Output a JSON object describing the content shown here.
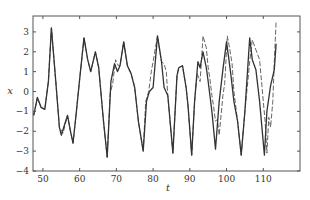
{
  "chart_data": {
    "type": "line",
    "title": "",
    "xlabel": "t",
    "ylabel": "x",
    "xlim": [
      47.3,
      120
    ],
    "ylim": [
      -4,
      3.8
    ],
    "xticks": [
      50,
      60,
      70,
      80,
      90,
      100,
      110
    ],
    "yticks": [
      -4,
      -3,
      -2,
      -1,
      0,
      1,
      2,
      3
    ],
    "grid": false,
    "legend": null,
    "series": [
      {
        "name": "true",
        "style": "solid",
        "color": "#333333",
        "t": [
          47.5,
          48.5,
          49.5,
          50.5,
          51.5,
          52.3,
          53.5,
          54.5,
          55,
          56,
          56.7,
          57.5,
          58.2,
          59,
          60,
          61.2,
          62.2,
          63,
          64.3,
          65.2,
          66.5,
          67.5,
          68.5,
          69.5,
          70.3,
          71,
          72,
          73,
          74,
          75,
          76,
          77.3,
          78.2,
          79,
          80,
          81.2,
          82.3,
          83,
          84,
          85.4,
          86.5,
          87,
          88,
          89,
          89.5,
          90.5,
          91.3,
          92.2,
          92.8,
          93.6,
          94.5,
          95,
          96,
          97,
          98,
          99,
          100,
          100.5,
          101.2,
          102,
          103,
          104,
          105,
          106.3,
          107,
          108,
          109,
          110.3,
          111,
          112,
          113,
          113.5
        ],
        "x": [
          -1.2,
          -0.3,
          -0.8,
          -0.9,
          0.5,
          3.2,
          0.5,
          -1.8,
          -2.2,
          -1.6,
          -1.2,
          -2.0,
          -2.6,
          -1.2,
          0.6,
          2.7,
          1.6,
          1.0,
          2.0,
          1.2,
          -1.5,
          -3.3,
          0.5,
          1.4,
          1.0,
          1.3,
          2.5,
          1.3,
          0.9,
          0.2,
          -1.5,
          -3.0,
          -0.5,
          0.0,
          0.2,
          2.8,
          1.5,
          0.2,
          -0.2,
          -3.1,
          0.8,
          1.2,
          1.3,
          0.2,
          -0.7,
          -3.2,
          -0.5,
          1.5,
          1.2,
          2.0,
          1.2,
          0.5,
          -1.0,
          -2.9,
          -0.5,
          1.1,
          2.5,
          1.8,
          0.8,
          -0.5,
          -1.5,
          -3.2,
          -1.0,
          2.7,
          1.6,
          1.1,
          -0.5,
          -3.2,
          -1.0,
          0.3,
          1.1,
          2.4
        ]
      },
      {
        "name": "prediction",
        "style": "dashed",
        "color": "#555555",
        "t": [
          47.5,
          48.5,
          49.5,
          50.5,
          51.5,
          52.3,
          53.5,
          54.5,
          55.5,
          56.7,
          57.5,
          58.2,
          59,
          60,
          61.2,
          62.2,
          63,
          64.3,
          65.2,
          66.5,
          67.5,
          68.3,
          69,
          69.8,
          70.5,
          71,
          72,
          73,
          74,
          75,
          76,
          77.3,
          78,
          78.8,
          79.5,
          80,
          81.2,
          82.3,
          83,
          83.6,
          84,
          85.4,
          86.5,
          87,
          88,
          89,
          89.5,
          90.5,
          91.3,
          92,
          92.8,
          93.6,
          94.5,
          95,
          95.5,
          96,
          96.5,
          97,
          97.5,
          98,
          99,
          99.5,
          100.2,
          100.8,
          101.5,
          102,
          103,
          104,
          105,
          106.3,
          107,
          108,
          109,
          110,
          110.5,
          111,
          111.5,
          112,
          112.6,
          113,
          113.5
        ],
        "x": [
          -1.2,
          -0.3,
          -0.8,
          -0.9,
          0.5,
          3.2,
          0.5,
          -1.8,
          -2.1,
          -1.2,
          -2.0,
          -2.6,
          -1.2,
          0.6,
          2.7,
          1.6,
          1.0,
          2.0,
          1.2,
          -1.5,
          -3.3,
          -0.1,
          0.4,
          1.6,
          1.3,
          1.3,
          2.5,
          1.3,
          0.9,
          0.2,
          -1.5,
          -3.0,
          -0.5,
          0.0,
          1.0,
          1.5,
          2.8,
          1.5,
          1.4,
          1.0,
          -0.2,
          -3.1,
          0.8,
          1.2,
          1.3,
          0.2,
          -0.7,
          -3.2,
          -0.5,
          0.9,
          0.5,
          2.8,
          2.2,
          1.2,
          0.6,
          -0.2,
          -0.8,
          -1.5,
          -1.4,
          -2.2,
          -0.2,
          0.4,
          2.8,
          2.2,
          1.4,
          0.0,
          -1.5,
          -3.2,
          -1.0,
          1.5,
          2.6,
          2.1,
          1.6,
          -0.5,
          -1.5,
          -3.1,
          -1.3,
          -1.8,
          -0.5,
          1.5,
          3.5
        ]
      }
    ]
  },
  "axes": {
    "xlabel": "t",
    "ylabel": "x",
    "xtick_labels": [
      "50",
      "60",
      "70",
      "80",
      "90",
      "100",
      "110"
    ],
    "ytick_labels": [
      "3",
      "2",
      "1",
      "0",
      "−1",
      "−2",
      "−3",
      "−4"
    ]
  }
}
